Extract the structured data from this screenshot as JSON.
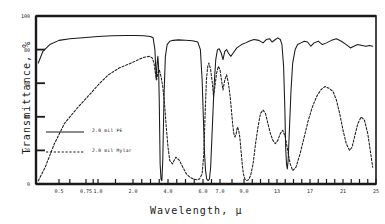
{
  "chart_data": {
    "type": "line",
    "title": "",
    "xlabel": "Wavelength, μ",
    "ylabel": "Transmittance, %",
    "xscale": "log-like-irspectrum",
    "xlim": [
      0.3,
      25
    ],
    "ylim": [
      0,
      100
    ],
    "grid": false,
    "legend_position": "inner-lower-left",
    "xticklabels": [
      "0.5",
      "0.75",
      "1.0",
      "2.0",
      "4.0",
      "6.0",
      "7.0",
      "9.0",
      "13",
      "17",
      "21",
      "25"
    ],
    "xtickvalues": [
      0.5,
      0.75,
      1.0,
      2.0,
      4.0,
      6.0,
      7.0,
      9.0,
      13,
      17,
      21,
      25
    ],
    "yticklabels": [
      "0",
      "20",
      "40",
      "60",
      "80",
      "100"
    ],
    "ytickvalues": [
      0,
      20,
      40,
      60,
      80,
      100
    ],
    "series": [
      {
        "name": "2.0 mil PE",
        "style": "solid",
        "color": "#1a1a1a",
        "points": [
          [
            0.32,
            72
          ],
          [
            0.36,
            79
          ],
          [
            0.42,
            83
          ],
          [
            0.5,
            85.5
          ],
          [
            0.6,
            86.5
          ],
          [
            0.75,
            87.2
          ],
          [
            1.0,
            87.8
          ],
          [
            1.4,
            88.2
          ],
          [
            1.8,
            88.4
          ],
          [
            2.2,
            88.4
          ],
          [
            2.6,
            88.2
          ],
          [
            3.0,
            87.8
          ],
          [
            3.15,
            87.0
          ],
          [
            3.25,
            80
          ],
          [
            3.33,
            62
          ],
          [
            3.38,
            72
          ],
          [
            3.42,
            76
          ],
          [
            3.46,
            70
          ],
          [
            3.5,
            50
          ],
          [
            3.55,
            12
          ],
          [
            3.6,
            3
          ],
          [
            3.65,
            2
          ],
          [
            3.7,
            14
          ],
          [
            3.78,
            55
          ],
          [
            3.85,
            76
          ],
          [
            3.95,
            83
          ],
          [
            4.1,
            85
          ],
          [
            4.3,
            85.5
          ],
          [
            4.6,
            85.8
          ],
          [
            5.0,
            85.6
          ],
          [
            5.4,
            85.3
          ],
          [
            5.7,
            84.5
          ],
          [
            5.85,
            80
          ],
          [
            5.95,
            62
          ],
          [
            6.02,
            40
          ],
          [
            6.08,
            20
          ],
          [
            6.15,
            8
          ],
          [
            6.22,
            3
          ],
          [
            6.3,
            2
          ],
          [
            6.38,
            3
          ],
          [
            6.45,
            10
          ],
          [
            6.55,
            34
          ],
          [
            6.65,
            58
          ],
          [
            6.75,
            74
          ],
          [
            6.85,
            80
          ],
          [
            6.95,
            80.5
          ],
          [
            7.1,
            78
          ],
          [
            7.25,
            74
          ],
          [
            7.4,
            79
          ],
          [
            7.55,
            80
          ],
          [
            7.7,
            78
          ],
          [
            7.9,
            76
          ],
          [
            8.1,
            78
          ],
          [
            8.4,
            81
          ],
          [
            8.8,
            83
          ],
          [
            9.2,
            84
          ],
          [
            9.6,
            85
          ],
          [
            10.2,
            86
          ],
          [
            10.8,
            85.5
          ],
          [
            11.3,
            84
          ],
          [
            11.7,
            86
          ],
          [
            12.1,
            86.5
          ],
          [
            12.4,
            84.5
          ],
          [
            12.8,
            86
          ],
          [
            13.1,
            87
          ],
          [
            13.4,
            86
          ],
          [
            13.6,
            83
          ],
          [
            13.8,
            70
          ],
          [
            13.95,
            45
          ],
          [
            14.05,
            22
          ],
          [
            14.15,
            12
          ],
          [
            14.25,
            9
          ],
          [
            14.35,
            14
          ],
          [
            14.5,
            32
          ],
          [
            14.7,
            56
          ],
          [
            14.9,
            72
          ],
          [
            15.2,
            80
          ],
          [
            15.5,
            83
          ],
          [
            15.9,
            84
          ],
          [
            16.3,
            85
          ],
          [
            16.7,
            84.5
          ],
          [
            17.1,
            82
          ],
          [
            17.5,
            84
          ],
          [
            18.0,
            85
          ],
          [
            18.5,
            83
          ],
          [
            19.0,
            84
          ],
          [
            19.6,
            85.5
          ],
          [
            20.2,
            86.5
          ],
          [
            20.8,
            85
          ],
          [
            21.4,
            83
          ],
          [
            21.9,
            81
          ],
          [
            22.3,
            82
          ],
          [
            22.8,
            83
          ],
          [
            23.3,
            82.5
          ],
          [
            23.8,
            82
          ],
          [
            24.2,
            82.5
          ],
          [
            24.6,
            82
          ]
        ]
      },
      {
        "name": "2.0 mil Mylar",
        "style": "dashed",
        "color": "#1a1a1a",
        "points": [
          [
            0.32,
            2
          ],
          [
            0.38,
            10
          ],
          [
            0.46,
            24
          ],
          [
            0.55,
            36
          ],
          [
            0.68,
            46
          ],
          [
            0.85,
            54
          ],
          [
            1.05,
            60
          ],
          [
            1.3,
            65
          ],
          [
            1.6,
            69
          ],
          [
            1.95,
            72
          ],
          [
            2.3,
            74
          ],
          [
            2.65,
            75.5
          ],
          [
            2.95,
            76
          ],
          [
            3.1,
            75
          ],
          [
            3.2,
            72
          ],
          [
            3.28,
            66
          ],
          [
            3.35,
            62
          ],
          [
            3.42,
            66
          ],
          [
            3.5,
            68
          ],
          [
            3.6,
            64
          ],
          [
            3.7,
            58
          ],
          [
            3.8,
            48
          ],
          [
            3.9,
            34
          ],
          [
            4.0,
            22
          ],
          [
            4.1,
            14
          ],
          [
            4.25,
            12
          ],
          [
            4.45,
            16
          ],
          [
            4.65,
            14
          ],
          [
            4.85,
            10
          ],
          [
            5.05,
            6
          ],
          [
            5.25,
            4
          ],
          [
            5.45,
            3
          ],
          [
            5.65,
            2.5
          ],
          [
            5.8,
            3
          ],
          [
            5.95,
            6
          ],
          [
            6.05,
            18
          ],
          [
            6.12,
            40
          ],
          [
            6.2,
            62
          ],
          [
            6.28,
            70
          ],
          [
            6.35,
            72
          ],
          [
            6.45,
            68
          ],
          [
            6.55,
            60
          ],
          [
            6.62,
            52
          ],
          [
            6.7,
            58
          ],
          [
            6.8,
            66
          ],
          [
            6.9,
            70
          ],
          [
            7.0,
            68
          ],
          [
            7.12,
            62
          ],
          [
            7.25,
            56
          ],
          [
            7.4,
            62
          ],
          [
            7.55,
            65
          ],
          [
            7.7,
            60
          ],
          [
            7.85,
            52
          ],
          [
            7.95,
            44
          ],
          [
            8.05,
            36
          ],
          [
            8.15,
            30
          ],
          [
            8.25,
            28
          ],
          [
            8.35,
            30
          ],
          [
            8.45,
            34
          ],
          [
            8.55,
            32
          ],
          [
            8.65,
            28
          ],
          [
            8.75,
            20
          ],
          [
            8.85,
            12
          ],
          [
            8.95,
            6
          ],
          [
            9.1,
            3
          ],
          [
            9.3,
            2
          ],
          [
            9.55,
            2.5
          ],
          [
            9.8,
            5
          ],
          [
            10.1,
            12
          ],
          [
            10.4,
            24
          ],
          [
            10.7,
            34
          ],
          [
            11.0,
            42
          ],
          [
            11.3,
            44
          ],
          [
            11.6,
            42
          ],
          [
            11.9,
            36
          ],
          [
            12.2,
            30
          ],
          [
            12.5,
            26
          ],
          [
            12.8,
            24
          ],
          [
            13.1,
            26
          ],
          [
            13.4,
            30
          ],
          [
            13.7,
            32
          ],
          [
            14.0,
            28
          ],
          [
            14.3,
            20
          ],
          [
            14.6,
            12
          ],
          [
            14.9,
            8
          ],
          [
            15.3,
            10
          ],
          [
            15.8,
            18
          ],
          [
            16.3,
            28
          ],
          [
            16.8,
            38
          ],
          [
            17.3,
            46
          ],
          [
            17.8,
            52
          ],
          [
            18.3,
            56
          ],
          [
            18.8,
            58
          ],
          [
            19.3,
            57
          ],
          [
            19.8,
            55
          ],
          [
            20.2,
            50
          ],
          [
            20.6,
            42
          ],
          [
            21.0,
            32
          ],
          [
            21.4,
            24
          ],
          [
            21.8,
            20
          ],
          [
            22.1,
            22
          ],
          [
            22.4,
            28
          ],
          [
            22.8,
            36
          ],
          [
            23.2,
            40
          ],
          [
            23.6,
            38
          ],
          [
            24.0,
            30
          ],
          [
            24.3,
            20
          ],
          [
            24.6,
            10
          ]
        ]
      }
    ]
  },
  "axes": {
    "y_title": "Transmittance, %",
    "x_title": "Wavelength, μ"
  },
  "legend": {
    "entries": [
      {
        "label": "2.0 mil PE",
        "style": "solid"
      },
      {
        "label": "2.0 mil Mylar",
        "style": "dashed"
      }
    ]
  }
}
